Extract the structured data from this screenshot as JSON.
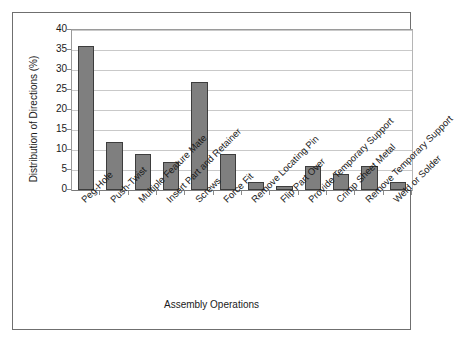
{
  "chart_data": {
    "type": "bar",
    "title": "",
    "xlabel": "Assembly Operations",
    "ylabel": "Distribution of Directions (%)",
    "ylim": [
      0,
      40
    ],
    "yticks": [
      0,
      5,
      10,
      15,
      20,
      25,
      30,
      35,
      40
    ],
    "grid": true,
    "legend": "none",
    "bar_color": "#7f7f7f",
    "bar_edge_color": "#3d3d3d",
    "gridline_color": "#c9c9c9",
    "frame_color": "#6f6f6f",
    "label_rotation": -45,
    "categories": [
      "Peg-Hole",
      "Push-Twist",
      "Multiple Feature Mate",
      "Insert Part and Retainer",
      "Screws",
      "Force Fit",
      "Remove Locating Pin",
      "Flip Part Over",
      "Provide Temporary Support",
      "Crimp Sheet Metal",
      "Remove Temporary Support",
      "Weld or Solder"
    ],
    "values": [
      36,
      12,
      9,
      7,
      27,
      9,
      2,
      1,
      6,
      4,
      6,
      2
    ]
  }
}
